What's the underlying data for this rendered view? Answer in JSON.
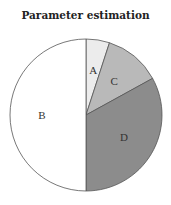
{
  "chart_data": {
    "type": "pie",
    "title": "Parameter estimation",
    "start_angle_deg": 0,
    "direction": "clockwise",
    "slices": [
      {
        "label": "A",
        "value": 5,
        "color": "#ececec"
      },
      {
        "label": "C",
        "value": 12,
        "color": "#b9b9b9"
      },
      {
        "label": "D",
        "value": 33,
        "color": "#8c8c8c"
      },
      {
        "label": "B",
        "value": 50,
        "color": "#ffffff"
      }
    ],
    "legend": "none",
    "labels_inside": true,
    "stroke_color": "#555555"
  }
}
